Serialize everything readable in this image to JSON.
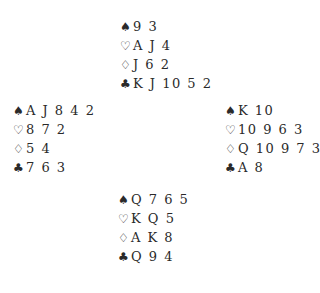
{
  "suits": {
    "spades": "♠",
    "hearts": "♡",
    "diamonds": "♢",
    "clubs": "♣"
  },
  "hands": {
    "north": {
      "spades": "9 3",
      "hearts": "A J 4",
      "diamonds": "J 6 2",
      "clubs": "K J 10 5 2"
    },
    "west": {
      "spades": "A J 8 4 2",
      "hearts": "8 7 2",
      "diamonds": "5 4",
      "clubs": "7 6 3"
    },
    "east": {
      "spades": "K 10",
      "hearts": "10 9 6 3",
      "diamonds": "Q 10 9 7 3",
      "clubs": "A 8"
    },
    "south": {
      "spades": "Q 7 6 5",
      "hearts": "K Q 5",
      "diamonds": "A K 8",
      "clubs": "Q 9 4"
    }
  }
}
